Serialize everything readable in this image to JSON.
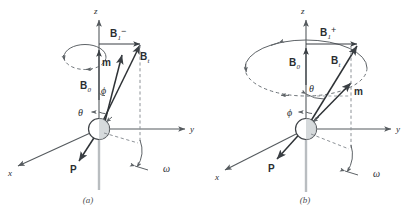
{
  "figure": {
    "type": "vector-diagram",
    "panels": [
      {
        "id": "a",
        "caption": "(a)",
        "axes": {
          "x": "x",
          "y": "y",
          "z": "z"
        },
        "labels": {
          "b1": "B",
          "b1_sub": "1",
          "b1_sup": "−",
          "bt": "B",
          "bt_sub": "t",
          "b0": "B",
          "b0_sub": "0",
          "m": "m",
          "p": "P",
          "theta": "θ",
          "phi": "ϕ",
          "omega": "ω"
        }
      },
      {
        "id": "b",
        "caption": "(b)",
        "axes": {
          "x": "x",
          "y": "y",
          "z": "z"
        },
        "labels": {
          "b1": "B",
          "b1_sub": "1",
          "b1_sup": "+",
          "bt": "B",
          "bt_sub": "t",
          "b0": "B",
          "b0_sub": "0",
          "m": "m",
          "p": "P",
          "theta": "θ",
          "phi": "ϕ",
          "omega": "ω"
        }
      }
    ],
    "colors": {
      "background": "#ffffff",
      "axis": "#555a5e",
      "vector": "#3a3f44",
      "dashed": "#8d9297",
      "sphere_fill": "#cfd3d6",
      "text": "#2a2d30"
    }
  }
}
